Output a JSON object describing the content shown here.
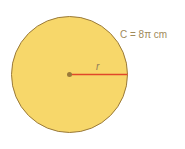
{
  "diagram": {
    "circumference_label": "C = 8π cm",
    "radius_label": "r",
    "colors": {
      "fill": "#f7d76a",
      "stroke": "#9a7a3a",
      "radius_line": "#e0472a",
      "center_dot": "#9a7a3a",
      "text": "#a08a5a"
    }
  }
}
